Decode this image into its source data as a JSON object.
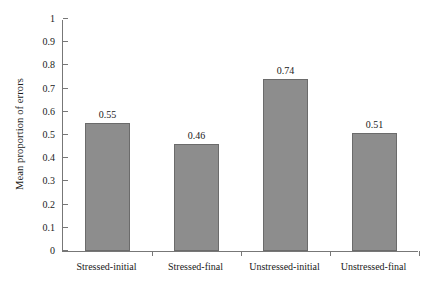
{
  "chart_data": {
    "type": "bar",
    "title": "",
    "xlabel": "",
    "ylabel": "Mean proportion of errors",
    "categories": [
      "Stressed-initial",
      "Stressed-final",
      "Unstressed-initial",
      "Unstressed-final"
    ],
    "values": [
      0.55,
      0.46,
      0.74,
      0.51
    ],
    "value_labels": [
      "0.55",
      "0.46",
      "0.74",
      "0.51"
    ],
    "ylim": [
      0,
      1
    ],
    "ytick_values": [
      0,
      0.1,
      0.2,
      0.3,
      0.4,
      0.5,
      0.6,
      0.7,
      0.8,
      0.9,
      1
    ],
    "ytick_labels": [
      "0",
      "0.1",
      "0.2",
      "0.3",
      "0.4",
      "0.5",
      "0.6",
      "0.7",
      "0.8",
      "0.9",
      "1"
    ],
    "grid": false,
    "legend": null,
    "series": [
      {
        "name": "Mean proportion of errors",
        "values": [
          0.55,
          0.46,
          0.74,
          0.51
        ]
      }
    ],
    "colors": {
      "bar_fill": "#8d8d8d",
      "bar_border": "#6b6b6b",
      "axis": "#777777",
      "text": "#1a1a1a",
      "background": "#ffffff"
    }
  }
}
